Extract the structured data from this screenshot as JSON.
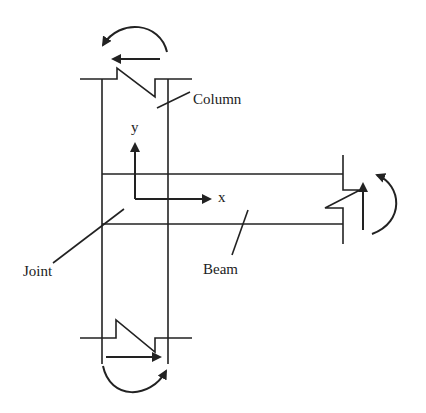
{
  "diagram": {
    "type": "beam-column joint free body",
    "labels": {
      "column": "Column",
      "beam": "Beam",
      "joint": "Joint",
      "axis_x": "x",
      "axis_y": "y"
    },
    "moments": [
      {
        "location": "top of column",
        "direction": "counterclockwise"
      },
      {
        "location": "bottom of column",
        "direction": "counterclockwise"
      },
      {
        "location": "beam end",
        "direction": "counterclockwise"
      }
    ],
    "shears": [
      {
        "location": "top of column",
        "direction": "left"
      },
      {
        "location": "bottom of column",
        "direction": "right"
      },
      {
        "location": "beam end",
        "direction": "up"
      }
    ],
    "colors": {
      "stroke": "#222222",
      "background": "#ffffff"
    }
  }
}
